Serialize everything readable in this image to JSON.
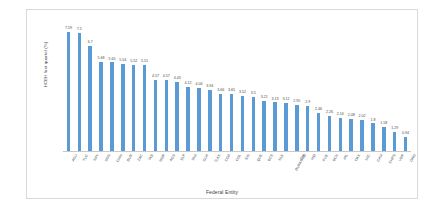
{
  "chart_data": {
    "type": "bar",
    "title": "",
    "xlabel": "Federal Entity",
    "ylabel": "HCEH first quartel (%)",
    "ylim": [
      0,
      8.2
    ],
    "grid": false,
    "legend": "none",
    "orientation": "vertical",
    "bar_color": "#5b9bd5",
    "categories": [
      "AGU",
      "YUC",
      "NAY",
      "SON",
      "CHIH",
      "DUR",
      "ZAC",
      "TAB",
      "MOR",
      "AGS",
      "SLP",
      "TAM",
      "GUA",
      "TLAX",
      "COA",
      "COL",
      "SIN",
      "QUE",
      "BCS",
      "NLE",
      "DURANGO",
      "CHI",
      "HID",
      "PUE",
      "BCN",
      "JAL",
      "OAX",
      "MIC",
      "CAM",
      "CHPS",
      "VER",
      "GRO"
    ],
    "values": [
      7.59,
      7.5,
      6.7,
      5.68,
      5.65,
      5.54,
      5.52,
      5.51,
      4.57,
      4.57,
      4.43,
      4.12,
      4.06,
      3.94,
      3.66,
      3.65,
      3.52,
      3.5,
      3.21,
      3.13,
      3.12,
      2.95,
      2.9,
      2.46,
      2.26,
      2.16,
      2.08,
      2.02,
      1.8,
      1.58,
      1.29,
      0.94
    ],
    "value_labels": [
      "7.59",
      "7.5",
      "6.7",
      "5.68",
      "5.65",
      "5.54",
      "5.52",
      "5.51",
      "4.57",
      "4.57",
      "4.43",
      "4.12",
      "4.06",
      "3.94",
      "3.66",
      "3.65",
      "3.52",
      "3.5",
      "3.21",
      "3.13",
      "3.12",
      "2.95",
      "2.9",
      "2.46",
      "2.26",
      "2.16",
      "2.08",
      "2.02",
      "1.8",
      "1.58",
      "1.29",
      "0.94"
    ]
  }
}
